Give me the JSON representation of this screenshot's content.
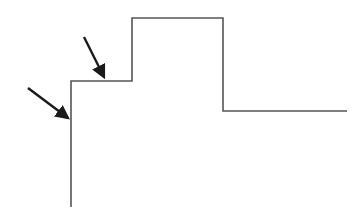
{
  "diagram": {
    "title": "",
    "background": "#ffffff",
    "line_color": "#555555",
    "arrow_color": "#1a1a1a",
    "step_profile": {
      "points": [
        [
          71,
          207
        ],
        [
          71,
          81
        ],
        [
          132,
          81
        ],
        [
          132,
          18
        ],
        [
          223,
          18
        ],
        [
          223,
          111
        ],
        [
          347,
          111
        ]
      ]
    },
    "arrows": [
      {
        "name": "arrow-to-vertical-edge",
        "from": [
          28,
          88
        ],
        "to": [
          68,
          118
        ]
      },
      {
        "name": "arrow-to-step-ledge",
        "from": [
          84,
          37
        ],
        "to": [
          104,
          77
        ]
      }
    ]
  }
}
